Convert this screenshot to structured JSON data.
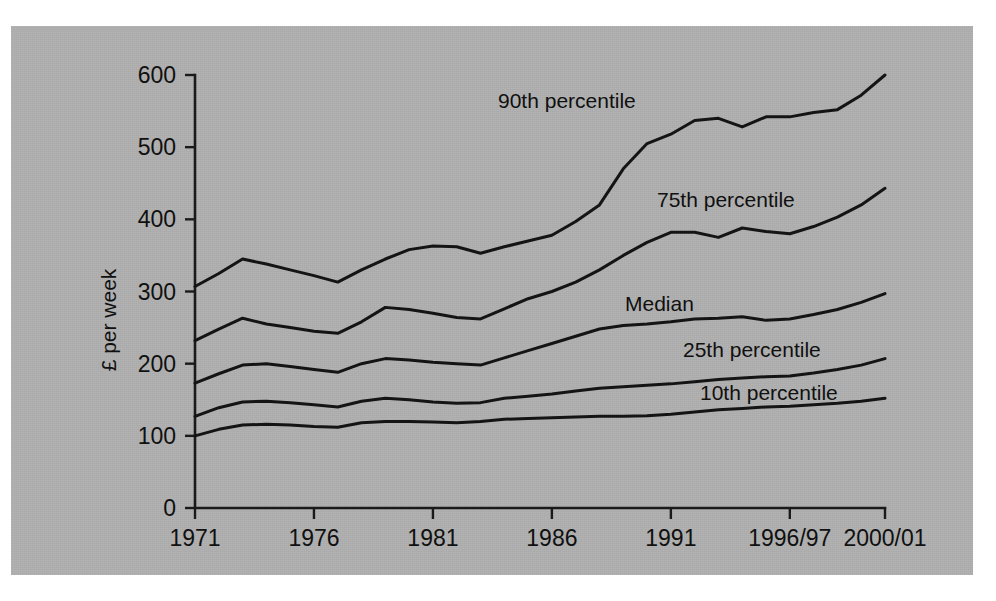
{
  "figure": {
    "panel_bg": "#b0b0b0",
    "page_bg": "#ffffff",
    "line_color": "#141414",
    "axis_color": "#1a1a1a"
  },
  "axes": {
    "y_title": "£ per week",
    "y_ticks": [
      "0",
      "100",
      "200",
      "300",
      "400",
      "500",
      "600"
    ],
    "x_ticks": [
      "1971",
      "1976",
      "1981",
      "1986",
      "1991",
      "1996/97",
      "2000/01"
    ]
  },
  "series_labels": {
    "p90": "90th percentile",
    "p75": "75th percentile",
    "median": "Median",
    "p25": "25th percentile",
    "p10": "10th percentile"
  },
  "chart_data": {
    "type": "line",
    "title": "",
    "xlabel": "",
    "ylabel": "£ per week",
    "ylim": [
      0,
      600
    ],
    "grid": false,
    "legend": "inline-labels",
    "x": [
      "1971",
      "1972",
      "1973",
      "1974",
      "1975",
      "1976",
      "1977",
      "1978",
      "1979",
      "1980",
      "1981",
      "1982",
      "1983",
      "1984",
      "1985",
      "1986",
      "1987",
      "1988",
      "1989",
      "1990",
      "1991",
      "1992",
      "1993",
      "1994",
      "1995",
      "1996/97",
      "1997/98",
      "1998/99",
      "1999/00",
      "2000/01"
    ],
    "x_tick_labels": [
      "1971",
      "1976",
      "1981",
      "1986",
      "1991",
      "1996/97",
      "2000/01"
    ],
    "x_tick_indices": [
      0,
      5,
      10,
      15,
      20,
      25,
      29
    ],
    "series": [
      {
        "name": "90th percentile",
        "values": [
          307,
          325,
          345,
          338,
          330,
          322,
          313,
          330,
          345,
          358,
          363,
          362,
          353,
          362,
          370,
          378,
          397,
          420,
          470,
          505,
          518,
          537,
          540,
          528,
          542,
          542,
          548,
          552,
          572,
          600
        ]
      },
      {
        "name": "75th percentile",
        "values": [
          232,
          248,
          263,
          255,
          250,
          245,
          242,
          258,
          278,
          275,
          270,
          264,
          262,
          276,
          290,
          300,
          313,
          330,
          350,
          368,
          382,
          382,
          375,
          388,
          383,
          380,
          390,
          403,
          420,
          443
        ]
      },
      {
        "name": "Median",
        "values": [
          173,
          186,
          198,
          200,
          196,
          192,
          188,
          200,
          207,
          205,
          202,
          200,
          198,
          208,
          218,
          228,
          238,
          248,
          253,
          255,
          258,
          262,
          263,
          265,
          260,
          262,
          268,
          275,
          285,
          297
        ]
      },
      {
        "name": "25th percentile",
        "values": [
          127,
          139,
          147,
          148,
          146,
          143,
          140,
          148,
          152,
          150,
          147,
          145,
          146,
          152,
          155,
          158,
          162,
          166,
          168,
          170,
          172,
          175,
          178,
          180,
          182,
          183,
          187,
          192,
          198,
          207
        ]
      },
      {
        "name": "10th percentile",
        "values": [
          100,
          109,
          115,
          116,
          115,
          113,
          112,
          118,
          120,
          120,
          119,
          118,
          120,
          123,
          124,
          125,
          126,
          127,
          127,
          128,
          130,
          133,
          136,
          138,
          140,
          141,
          143,
          145,
          148,
          152
        ]
      }
    ]
  },
  "annotations": [
    {
      "text": "90th percentile",
      "x_px": 498,
      "y_px": 108
    },
    {
      "text": "75th percentile",
      "x_px": 657,
      "y_px": 207
    },
    {
      "text": "Median",
      "x_px": 625,
      "y_px": 311
    },
    {
      "text": "25th percentile",
      "x_px": 683,
      "y_px": 357
    },
    {
      "text": "10th percentile",
      "x_px": 700,
      "y_px": 400
    }
  ]
}
